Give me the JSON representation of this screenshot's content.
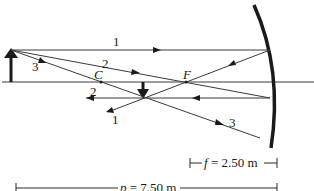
{
  "diagram": {
    "type": "ray-diagram-concave-mirror",
    "points": {
      "center_of_curvature": "C",
      "focal_point": "F"
    },
    "ray_labels": {
      "ray1_incident": "1",
      "ray1_reflected": "1",
      "ray2_incident": "2",
      "ray2_reflected": "2",
      "ray3_incident": "3",
      "ray3_reflected": "3"
    },
    "dimensions": {
      "focal_length": "f = 2.50 m",
      "object_distance": "p = 7.50 m"
    },
    "focal_length_var": "f",
    "focal_length_value": " = 2.50 m",
    "object_distance_var": "p",
    "object_distance_value": " = 7.50 m",
    "colors": {
      "line": "#3a3a3a",
      "mirror": "#1a1a1a",
      "background": "#ffffff"
    }
  }
}
